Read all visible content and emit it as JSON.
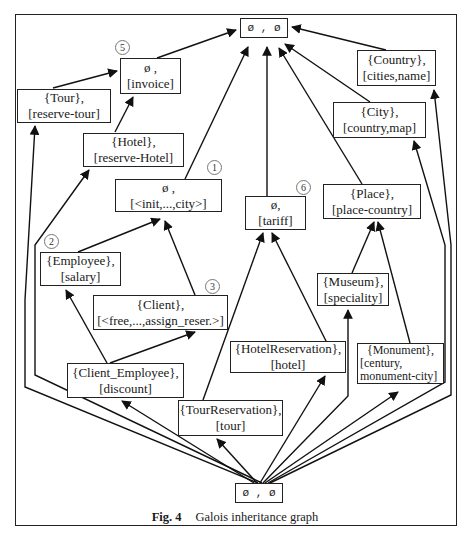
{
  "figure": {
    "caption_label": "Fig. 4",
    "caption_text": "Galois inheritance graph"
  },
  "nodes": {
    "top": {
      "line1": "ø , ø",
      "line2": ""
    },
    "invoice": {
      "line1": "ø ,",
      "line2": "[invoice]",
      "badge": "5"
    },
    "tour": {
      "line1": "{Tour},",
      "line2": "[reserve-tour]"
    },
    "hotel": {
      "line1": "{Hotel},",
      "line2": "[reserve-Hotel]"
    },
    "init": {
      "line1": "ø ,",
      "line2": "[<init,...,city>]",
      "badge": "1"
    },
    "tariff": {
      "line1": "ø,",
      "line2": "[tariff]",
      "badge": "6"
    },
    "country": {
      "line1": "{Country},",
      "line2": "[cities,name]"
    },
    "city": {
      "line1": "{City},",
      "line2": "[country,map]"
    },
    "place": {
      "line1": "{Place},",
      "line2": "[place-country]"
    },
    "employee": {
      "line1": "{Employee},",
      "line2": "[salary]",
      "badge": "2"
    },
    "client": {
      "line1": "{Client},",
      "line2": "[<free,...,assign_reser.>]",
      "badge": "3"
    },
    "museum": {
      "line1": "{Museum},",
      "line2": "[speciality]"
    },
    "hotel_reservation": {
      "line1": "{HotelReservation},",
      "line2": "[hotel]"
    },
    "monument": {
      "line1": "{Monument},",
      "line2": "[century,",
      "line3": "monument-city]"
    },
    "client_employee": {
      "line1": "{Client_Employee},",
      "line2": "[discount]"
    },
    "tour_reservation": {
      "line1": "{TourReservation},",
      "line2": "[tour]"
    },
    "bottom": {
      "line1": "ø , ø",
      "line2": ""
    }
  },
  "edges": [
    [
      "invoice",
      "top"
    ],
    [
      "init",
      "top"
    ],
    [
      "tariff",
      "top"
    ],
    [
      "place",
      "top"
    ],
    [
      "city",
      "top"
    ],
    [
      "country",
      "top"
    ],
    [
      "tour",
      "invoice"
    ],
    [
      "hotel",
      "invoice"
    ],
    [
      "employee",
      "init"
    ],
    [
      "client",
      "init"
    ],
    [
      "employee",
      "hotel"
    ],
    [
      "client_employee",
      "employee"
    ],
    [
      "client_employee",
      "client"
    ],
    [
      "tour_reservation",
      "tariff"
    ],
    [
      "hotel_reservation",
      "tariff"
    ],
    [
      "museum",
      "place"
    ],
    [
      "monument",
      "place"
    ],
    [
      "bottom",
      "tour"
    ],
    [
      "bottom",
      "employee"
    ],
    [
      "bottom",
      "client_employee"
    ],
    [
      "bottom",
      "tour_reservation"
    ],
    [
      "bottom",
      "hotel_reservation"
    ],
    [
      "bottom",
      "museum"
    ],
    [
      "bottom",
      "monument"
    ],
    [
      "bottom",
      "city"
    ],
    [
      "bottom",
      "country"
    ]
  ]
}
